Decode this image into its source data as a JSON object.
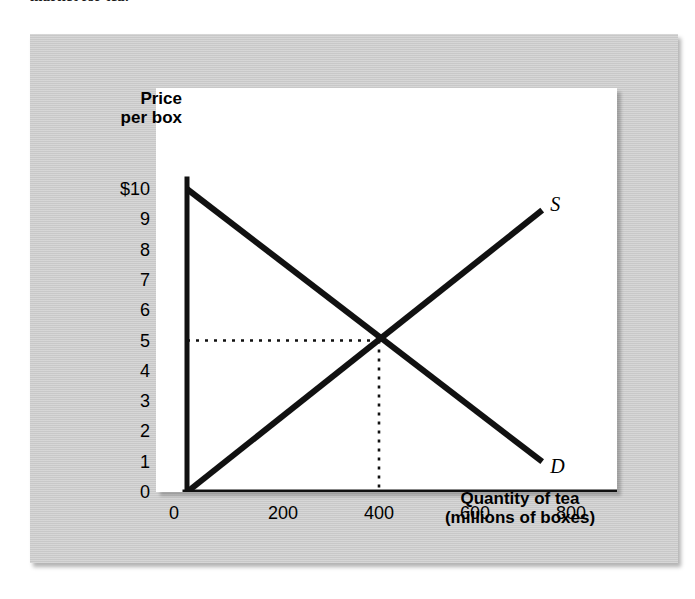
{
  "caption": {
    "partial_text": "market for tea."
  },
  "figure": {
    "y_axis_title": "Price\nper box",
    "x_axis_title": "Quantity of tea\n(millions of boxes)"
  },
  "chart_data": {
    "type": "line",
    "title": "",
    "subtitle": "",
    "xlabel": "Quantity of tea (millions of boxes)",
    "ylabel": "Price per box",
    "xlim": [
      0,
      840
    ],
    "ylim": [
      0,
      10
    ],
    "grid": false,
    "legend": "inline-curve-labels",
    "xticks": [
      0,
      200,
      400,
      600,
      800
    ],
    "xtick_labels": [
      "0",
      "200",
      "400",
      "600",
      "800"
    ],
    "yticks": [
      0,
      1,
      2,
      3,
      4,
      5,
      6,
      7,
      8,
      9,
      10
    ],
    "ytick_labels": [
      "0",
      "1",
      "2",
      "3",
      "4",
      "5",
      "6",
      "7",
      "8",
      "9",
      "$10"
    ],
    "series": [
      {
        "name": "D",
        "label": "D",
        "role": "demand",
        "color": "#111111",
        "x": [
          0,
          740
        ],
        "y": [
          10,
          1
        ]
      },
      {
        "name": "S",
        "label": "S",
        "role": "supply",
        "color": "#111111",
        "x": [
          0,
          740
        ],
        "y": [
          0,
          9.3
        ]
      }
    ],
    "annotations": [
      {
        "name": "equilibrium",
        "type": "dotted-guides",
        "x": 400,
        "y": 5,
        "color": "#111111"
      }
    ]
  }
}
